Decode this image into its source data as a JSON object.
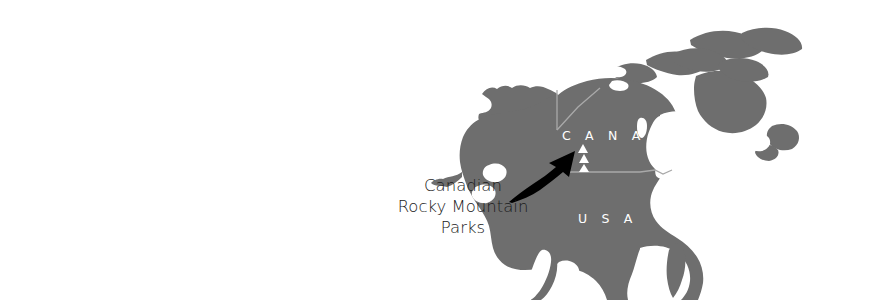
{
  "figure": {
    "kind": "locator-map",
    "region": "North America",
    "canvas": {
      "width": 876,
      "height": 300
    },
    "background_color": "#ffffff"
  },
  "map": {
    "landmass_color": "#6e6e6e",
    "water_color": "#ffffff",
    "border_color": "#a9a9a9",
    "country_labels": [
      {
        "name": "canada-label",
        "text": "C A N A D A",
        "x": 562,
        "y": 140
      },
      {
        "name": "usa-label",
        "text": "U S A",
        "x": 578,
        "y": 223
      }
    ]
  },
  "marker": {
    "icon_name": "mountain-triangles-icon",
    "count": 3,
    "color": "#ffffff",
    "x": 583,
    "y": 158
  },
  "callout": {
    "arrow_color": "#000000",
    "text_color": "#1a1a1a",
    "lines": [
      {
        "text": "Canadian",
        "x": 463,
        "y": 191
      },
      {
        "text": "Rocky Mountain",
        "x": 463,
        "y": 212
      },
      {
        "text": "Parks",
        "x": 463,
        "y": 233
      }
    ]
  }
}
